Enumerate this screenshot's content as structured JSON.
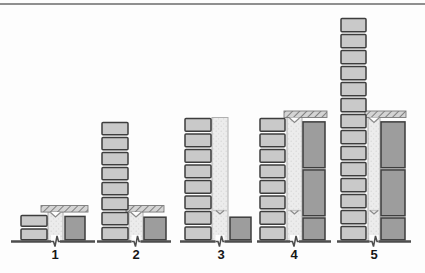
{
  "figure": {
    "type": "masonry-construction-stages-diagram",
    "stages": [
      {
        "label": "1",
        "left_bricks": 2,
        "mid_units": 1.9,
        "cap": true,
        "mid_full": false,
        "mid_joint": false,
        "dark_blocks_units": [
          1.65
        ]
      },
      {
        "label": "2",
        "left_bricks": 8,
        "mid_units": 1.9,
        "cap": true,
        "mid_full": false,
        "mid_joint": false,
        "dark_blocks_units": [
          1.6
        ]
      },
      {
        "label": "3",
        "left_bricks": 8,
        "mid_units": 8,
        "cap": false,
        "mid_full": true,
        "mid_joint": true,
        "dark_blocks_units": [
          1.6
        ]
      },
      {
        "label": "4",
        "left_bricks": 8,
        "mid_units": 8,
        "cap": true,
        "mid_full": true,
        "mid_joint": true,
        "dark_blocks_units": [
          1.55,
          3.1,
          3.1
        ]
      },
      {
        "label": "5",
        "left_bricks": 14,
        "mid_units": 8,
        "cap": true,
        "mid_full": true,
        "mid_joint": true,
        "dark_blocks_units": [
          1.55,
          3.1,
          3.1
        ]
      }
    ],
    "colors": {
      "background": "#fdfdfd",
      "top_rule": "#8f8f8f",
      "brick_fill": "#c9c9c9",
      "brick_outline": "#3d3d3d",
      "mortar_fill": "#ececec",
      "mortar_dot": "#d7d7d7",
      "mortar_edge": "#b0b0b0",
      "block_fill": "#9d9d9d",
      "block_outline": "#3d3d3d",
      "cap_fill": "#d4d4d4",
      "cap_hatch": "#5a5a5a",
      "cap_outline": "#7a7a7a",
      "ground": "#4d4d4d",
      "notch": "#8a8a8a",
      "label": "#161616"
    }
  }
}
